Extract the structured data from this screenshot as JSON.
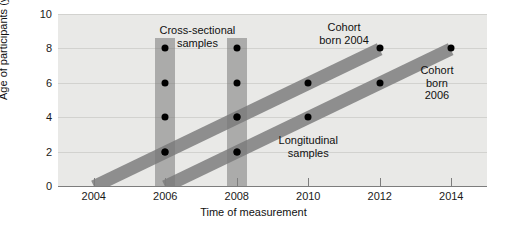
{
  "chart_data": {
    "type": "line",
    "title": "",
    "xlabel": "Time of measurement",
    "ylabel": "Age of participants (years)",
    "xlim": [
      2003,
      2015
    ],
    "ylim": [
      0,
      10
    ],
    "xticks": [
      2004,
      2006,
      2008,
      2010,
      2012,
      2014
    ],
    "xtick_labels": [
      "2004",
      "2006",
      "2008",
      "2010",
      "2012",
      "2014"
    ],
    "yticks": [
      0,
      2,
      4,
      6,
      8,
      10
    ],
    "ytick_labels": [
      "0",
      "2",
      "4",
      "6",
      "8",
      "10"
    ],
    "grid": true,
    "legend_position": "none",
    "series": [
      {
        "name": "Cohort born 2004",
        "style": "diagonal-band",
        "x": [
          2004,
          2006,
          2008,
          2010,
          2012
        ],
        "y": [
          0,
          2,
          4,
          6,
          8
        ],
        "points": [
          {
            "x": 2006,
            "y": 2
          },
          {
            "x": 2008,
            "y": 4
          },
          {
            "x": 2010,
            "y": 6
          },
          {
            "x": 2012,
            "y": 8
          }
        ]
      },
      {
        "name": "Cohort born 2006",
        "style": "diagonal-band",
        "x": [
          2006,
          2008,
          2010,
          2012,
          2014
        ],
        "y": [
          0,
          2,
          4,
          6,
          8
        ],
        "points": [
          {
            "x": 2008,
            "y": 2
          },
          {
            "x": 2010,
            "y": 4
          },
          {
            "x": 2012,
            "y": 6
          },
          {
            "x": 2014,
            "y": 8
          }
        ]
      },
      {
        "name": "Cross-sectional samples 2006",
        "style": "vertical-band",
        "x": 2006,
        "y_range": [
          0,
          8.6
        ],
        "points": [
          {
            "x": 2006,
            "y": 8
          },
          {
            "x": 2006,
            "y": 6
          },
          {
            "x": 2006,
            "y": 4
          },
          {
            "x": 2006,
            "y": 2
          }
        ]
      },
      {
        "name": "Cross-sectional samples 2008",
        "style": "vertical-band",
        "x": 2008,
        "y_range": [
          0,
          8.6
        ],
        "points": [
          {
            "x": 2008,
            "y": 8
          },
          {
            "x": 2008,
            "y": 6
          },
          {
            "x": 2008,
            "y": 4
          },
          {
            "x": 2008,
            "y": 2
          }
        ]
      }
    ],
    "annotations": [
      {
        "name": "cross-sectional-samples",
        "text": "Cross-sectional\nsamples",
        "x": 2006.9,
        "y": 9.4
      },
      {
        "name": "cohort-born-2004",
        "text": "Cohort\nborn 2004",
        "x": 2011.0,
        "y": 9.6
      },
      {
        "name": "cohort-born-2006",
        "text": "Cohort\nborn\n2006",
        "x": 2013.6,
        "y": 7.1
      },
      {
        "name": "longitudinal-samples",
        "text": "Longitudinal\nsamples",
        "x": 2010.0,
        "y": 3.0
      }
    ],
    "colors": {
      "plot_background": "#e9e9e7",
      "gridline": "#d2d2cf",
      "band": "#8e8e8e",
      "cross_sectional_bar": "#9a9a9a",
      "dot": "#000000",
      "axis": "#7d7d7d",
      "text": "#111111"
    }
  }
}
